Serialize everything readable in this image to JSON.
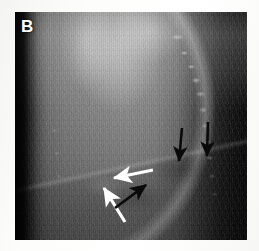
{
  "figure": {
    "panel_label": "B",
    "modality": "lateral chest radiograph",
    "background_color": "#ffffff",
    "plate_color": "#0a0a0a"
  },
  "annotations": {
    "white_arrow_color": "#ffffff",
    "black_arrow_color": "#0a0a0a",
    "items": [
      {
        "id": "black-arrow-down-left",
        "name": "black-arrow-down-1",
        "color": "#0a0a0a",
        "direction": "down",
        "tail": [
          167,
          116
        ],
        "tip": [
          164,
          149
        ]
      },
      {
        "id": "black-arrow-down-right",
        "name": "black-arrow-down-2",
        "color": "#0a0a0a",
        "direction": "down",
        "tail": [
          193,
          110
        ],
        "tip": [
          192,
          144
        ]
      },
      {
        "id": "white-arrow-left",
        "name": "white-arrow-horizontal",
        "color": "#ffffff",
        "direction": "left",
        "tail": [
          138,
          158
        ],
        "tip": [
          97,
          166
        ]
      },
      {
        "id": "white-arrow-upleft",
        "name": "white-arrow-diagonal",
        "color": "#ffffff",
        "direction": "up-left",
        "tail": [
          110,
          210
        ],
        "tip": [
          87,
          173
        ]
      },
      {
        "id": "black-arrow-upright",
        "name": "black-arrow-diagonal",
        "color": "#0a0a0a",
        "direction": "up-right",
        "tail": [
          100,
          196
        ],
        "tip": [
          133,
          171
        ]
      }
    ]
  }
}
